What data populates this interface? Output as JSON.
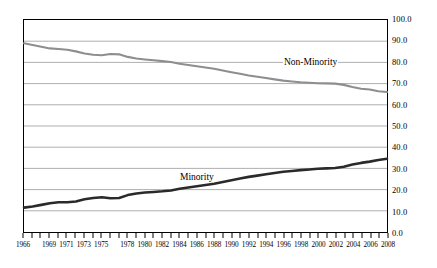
{
  "chart_data": {
    "type": "line",
    "title": "",
    "subtitle": "",
    "xlabel": "",
    "ylabel": "",
    "ylim": [
      0.0,
      100.0
    ],
    "xlim": [
      1966,
      2008
    ],
    "grid": true,
    "grid_orientation": "horizontal",
    "y_axis_position": "right",
    "legend_position": "inline-annotations",
    "y_ticks": [
      "0.0",
      "10.0",
      "20.0",
      "30.0",
      "40.0",
      "50.0",
      "60.0",
      "70.0",
      "80.0",
      "90.0",
      "100.0"
    ],
    "y_tick_values": [
      0,
      10,
      20,
      30,
      40,
      50,
      60,
      70,
      80,
      90,
      100
    ],
    "x_tick_labels": [
      "1966",
      "1969",
      "1971",
      "1973",
      "1975",
      "1978",
      "1980",
      "1982",
      "1984",
      "1986",
      "1988",
      "1990",
      "1992",
      "1994",
      "1996",
      "1998",
      "2000",
      "2002",
      "2004",
      "2006",
      "2008"
    ],
    "x": [
      1966,
      1967,
      1968,
      1969,
      1970,
      1971,
      1972,
      1973,
      1974,
      1975,
      1976,
      1977,
      1978,
      1979,
      1980,
      1981,
      1982,
      1983,
      1984,
      1985,
      1986,
      1987,
      1988,
      1989,
      1990,
      1991,
      1992,
      1993,
      1994,
      1995,
      1996,
      1997,
      1998,
      1999,
      2000,
      2001,
      2002,
      2003,
      2004,
      2005,
      2006,
      2007,
      2008
    ],
    "series": [
      {
        "name": "Non-Minority",
        "color": "#8e8e8e",
        "values": [
          89.0,
          88.2,
          87.4,
          86.6,
          86.3,
          86.0,
          85.2,
          84.2,
          83.6,
          83.4,
          84.0,
          83.8,
          82.6,
          81.8,
          81.4,
          81.0,
          80.6,
          80.2,
          79.4,
          78.8,
          78.2,
          77.6,
          77.0,
          76.2,
          75.4,
          74.6,
          73.8,
          73.2,
          72.6,
          72.0,
          71.4,
          71.0,
          70.6,
          70.4,
          70.2,
          70.1,
          70.0,
          69.4,
          68.4,
          67.6,
          67.2,
          66.4,
          66.0
        ]
      },
      {
        "name": "Minority",
        "color": "#2a2a2a",
        "values": [
          11.5,
          12.0,
          12.8,
          13.6,
          14.0,
          14.0,
          14.4,
          15.4,
          16.0,
          16.4,
          15.9,
          16.0,
          17.4,
          18.2,
          18.6,
          18.9,
          19.2,
          19.6,
          20.4,
          21.0,
          21.6,
          22.2,
          22.8,
          23.6,
          24.4,
          25.2,
          26.0,
          26.6,
          27.2,
          27.8,
          28.4,
          28.8,
          29.2,
          29.5,
          29.8,
          30.0,
          30.2,
          30.8,
          31.8,
          32.6,
          33.2,
          34.0,
          34.6
        ]
      }
    ],
    "annotations": [
      {
        "text": "Non-Minority",
        "series": "Non-Minority"
      },
      {
        "text": "Minority",
        "series": "Minority"
      }
    ]
  }
}
